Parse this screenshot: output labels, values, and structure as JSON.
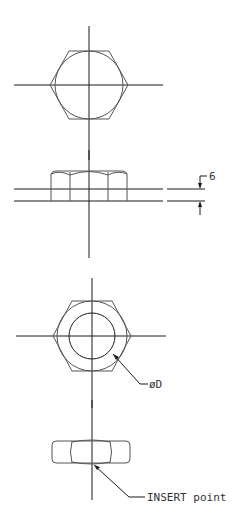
{
  "drawing": {
    "title": "Hex nut CAD views",
    "views": [
      {
        "name": "hex-nut-top-view-plain",
        "center": [
          89,
          85
        ]
      },
      {
        "name": "hex-nut-side-view",
        "thickness_dimension": "6"
      },
      {
        "name": "hex-nut-top-view-with-bore",
        "center": [
          92,
          336
        ]
      },
      {
        "name": "hex-nut-side-view-insert"
      }
    ],
    "annotations": {
      "thickness_label": "6",
      "diameter_label": "øD",
      "insert_label": "INSERT point"
    }
  }
}
